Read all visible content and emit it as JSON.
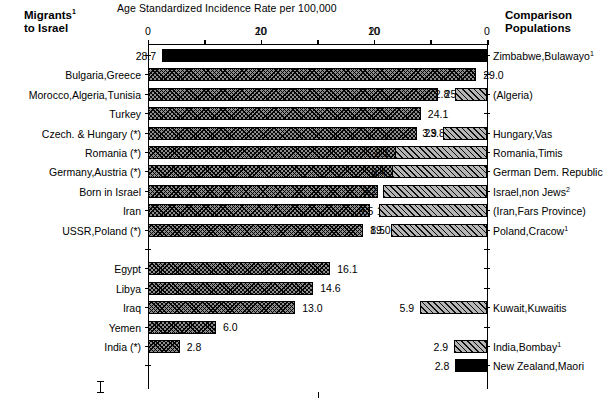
{
  "chart_title": "Age Standardized Incidence Rate per 100,000",
  "left_header_line1": "Migrants",
  "left_header_sup": "1",
  "left_header_line2": "to Israel",
  "right_header_line1": "Comparison",
  "right_header_line2": "Populations",
  "axes": {
    "left_ticks": [
      0,
      5,
      10,
      15,
      20,
      25,
      30
    ],
    "left_labeled": [
      "0",
      "10",
      "20"
    ],
    "right_ticks": [
      25,
      20,
      15,
      10,
      5,
      0
    ],
    "right_labeled": [
      "20",
      "10",
      "0"
    ],
    "left_origin_px": 148,
    "right_origin_px": 487,
    "px_per_unit": 11.32,
    "left_direction": "right",
    "right_direction": "left"
  },
  "chart_data": {
    "type": "bar",
    "orientation": "horizontal",
    "layout": "back-to-back paired bars",
    "title": "Age Standardized Incidence Rate per 100,000",
    "xlabel": "Age Standardized Incidence Rate per 100,000",
    "ylabel": "",
    "xlim_left": [
      0,
      30
    ],
    "xlim_right": [
      0,
      25
    ],
    "grid": false,
    "legend": null,
    "series": [
      {
        "name": "Migrants to Israel",
        "fill": "cross-hatch"
      },
      {
        "name": "Comparison Populations",
        "fill": "diagonal-hatch"
      },
      {
        "name": "Highest / Lowest reference",
        "fill": "solid-black"
      }
    ],
    "rows": [
      {
        "left_label": "",
        "left_value": null,
        "right_value": 28.7,
        "right_label": "Zimbabwe,Bulawayo",
        "right_label_sup": "1",
        "right_fill": "solid"
      },
      {
        "left_label": "Bulgaria,Greece",
        "left_value": 29.0,
        "right_value": null,
        "right_label": ""
      },
      {
        "left_label": "Morocco,Algeria,Tunisia",
        "left_value": 25.6,
        "right_value": 2.8,
        "right_label": "(Algeria)"
      },
      {
        "left_label": "Turkey",
        "left_value": 24.1,
        "right_value": null,
        "right_label": ""
      },
      {
        "left_label": "Czech. & Hungary (*)",
        "left_value": 23.8,
        "right_value": 3.9,
        "right_label": "Hungary,Vas"
      },
      {
        "left_label": "Romania (*)",
        "left_value": 23.1,
        "right_value": 8.1,
        "right_label": "Romania,Timis"
      },
      {
        "left_label": "Germany,Austria (*)",
        "left_value": 22.9,
        "right_value": 8.4,
        "right_label": "German Dem. Republic"
      },
      {
        "left_label": "Born in Israel",
        "left_value": 20.3,
        "right_value": 9.2,
        "right_label": "Israel,non Jews",
        "right_label_sup": "2"
      },
      {
        "left_label": "Iran",
        "left_value": 19.6,
        "right_value": 9.5,
        "right_label": "(Iran,Fars Province)"
      },
      {
        "left_label": "USSR,Poland (*)",
        "left_value": 19.0,
        "right_value": 8.5,
        "right_label": "Poland,Cracow",
        "right_label_sup": "1"
      },
      {
        "left_label": "",
        "left_value": null,
        "right_value": null,
        "right_label": ""
      },
      {
        "left_label": "Egypt",
        "left_value": 16.1,
        "right_value": null,
        "right_label": ""
      },
      {
        "left_label": "Libya",
        "left_value": 14.6,
        "right_value": null,
        "right_label": ""
      },
      {
        "left_label": "Iraq",
        "left_value": 13.0,
        "right_value": 5.9,
        "right_label": "Kuwait,Kuwaitis"
      },
      {
        "left_label": "Yemen",
        "left_value": 6.0,
        "right_value": null,
        "right_label": ""
      },
      {
        "left_label": "India (*)",
        "left_value": 2.8,
        "right_value": 2.9,
        "right_label": "India,Bombay",
        "right_label_sup": "1"
      },
      {
        "left_label": "",
        "left_value": null,
        "right_value": 2.8,
        "right_label": "New Zealand,Maori",
        "right_fill": "solid"
      }
    ]
  },
  "colors": {
    "ink": "#000000",
    "left_bar_fill": "#8d8d8d",
    "right_bar_fill": "#b6b6b6",
    "solid_bar": "#000000",
    "background": "#ffffff"
  }
}
